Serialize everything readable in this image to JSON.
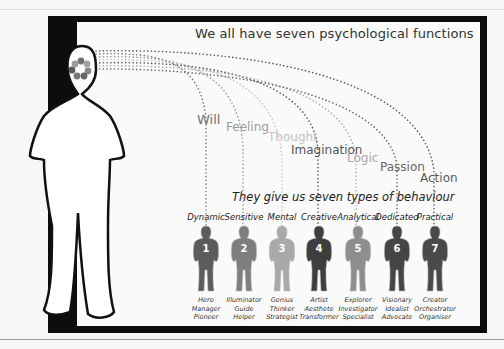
{
  "title": "We all have seven psychological functions",
  "subtitle": "They give us seven types of behaviour",
  "colors": {
    "frame": "#0d0d0d",
    "panel": "#fafafa",
    "figure_outline": "#111111"
  },
  "functions": [
    {
      "label": "Will",
      "color": "#707070"
    },
    {
      "label": "Feeling",
      "color": "#9a9a9a"
    },
    {
      "label": "Thought",
      "color": "#c2c2c2"
    },
    {
      "label": "Imagination",
      "color": "#555555"
    },
    {
      "label": "Logic",
      "color": "#a8a8a8"
    },
    {
      "label": "Passion",
      "color": "#666666"
    },
    {
      "label": "Action",
      "color": "#5a5a5a"
    }
  ],
  "behaviours": [
    {
      "number": "1",
      "type": "Dynamic",
      "color": "#5c5c5c",
      "roles": [
        "Hero",
        "Manager",
        "Pioneer"
      ]
    },
    {
      "number": "2",
      "type": "Sensitive",
      "color": "#7e7e7e",
      "roles": [
        "Illuminator",
        "Guide",
        "Helper"
      ]
    },
    {
      "number": "3",
      "type": "Mental",
      "color": "#a9a9a9",
      "roles": [
        "Genius",
        "Thinker",
        "Strategist"
      ]
    },
    {
      "number": "4",
      "type": "Creative",
      "color": "#3e3e3e",
      "roles": [
        "Artist",
        "Aesthete",
        "Transformer"
      ]
    },
    {
      "number": "5",
      "type": "Analytical",
      "color": "#8e8e8e",
      "roles": [
        "Explorer",
        "Investigator",
        "Specialist"
      ]
    },
    {
      "number": "6",
      "type": "Dedicated",
      "color": "#454545",
      "roles": [
        "Visionary",
        "Idealist",
        "Advocate"
      ]
    },
    {
      "number": "7",
      "type": "Practical",
      "color": "#4a4a4a",
      "roles": [
        "Creator",
        "Orchestrator",
        "Organiser"
      ]
    }
  ]
}
